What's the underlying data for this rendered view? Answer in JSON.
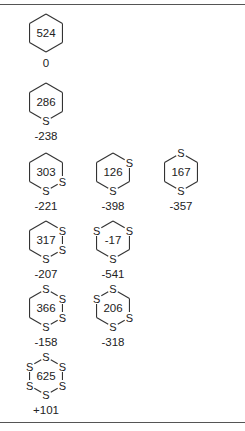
{
  "diagram": {
    "type": "ring-strain-energy-table",
    "ring_size": 6,
    "atom_label_sulfur": "S",
    "molecules": [
      {
        "id": "cyclohexane",
        "center_value": "524",
        "energy": "0",
        "s_positions": []
      },
      {
        "id": "thiane",
        "center_value": "286",
        "energy": "-238",
        "s_positions": [
          3
        ]
      },
      {
        "id": "1,2-dithiane",
        "center_value": "303",
        "energy": "-221",
        "s_positions": [
          2,
          3
        ]
      },
      {
        "id": "1,3-dithiane",
        "center_value": "126",
        "energy": "-398",
        "s_positions": [
          1,
          3
        ]
      },
      {
        "id": "1,4-dithiane",
        "center_value": "167",
        "energy": "-357",
        "s_positions": [
          0,
          3
        ]
      },
      {
        "id": "1,2,3-trithiane",
        "center_value": "317",
        "energy": "-207",
        "s_positions": [
          1,
          2,
          3
        ]
      },
      {
        "id": "1,3,5-trithiane",
        "center_value": "-17",
        "energy": "-541",
        "s_positions": [
          1,
          3,
          5
        ]
      },
      {
        "id": "1,2,3,4-tetrathiane",
        "center_value": "366",
        "energy": "-158",
        "s_positions": [
          0,
          1,
          2,
          3
        ]
      },
      {
        "id": "1,2,4,5-tetrathiane",
        "center_value": "206",
        "energy": "-318",
        "s_positions": [
          0,
          2,
          3,
          5
        ]
      },
      {
        "id": "hexathiane",
        "center_value": "625",
        "energy": "+101",
        "s_positions": [
          0,
          1,
          2,
          3,
          4,
          5
        ]
      }
    ],
    "layout": [
      {
        "molecule": 0,
        "x": 46,
        "y": 33
      },
      {
        "molecule": 1,
        "x": 46,
        "y": 102
      },
      {
        "molecule": 2,
        "x": 46,
        "y": 172
      },
      {
        "molecule": 3,
        "x": 113,
        "y": 172
      },
      {
        "molecule": 4,
        "x": 181,
        "y": 172
      },
      {
        "molecule": 5,
        "x": 46,
        "y": 240
      },
      {
        "molecule": 6,
        "x": 113,
        "y": 240
      },
      {
        "molecule": 7,
        "x": 46,
        "y": 308
      },
      {
        "molecule": 8,
        "x": 113,
        "y": 308
      },
      {
        "molecule": 9,
        "x": 46,
        "y": 376
      }
    ]
  }
}
